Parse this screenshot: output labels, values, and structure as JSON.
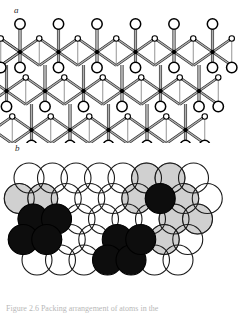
{
  "figure": {
    "panels": [
      {
        "id": "a",
        "label": "a",
        "type": "ball-and-stick-lattice",
        "description": "Ball-and-stick model of a layered hexagonal crystal lattice with large open circles, small open circles and filled black nodes joined by double-line bonds",
        "colors": {
          "node_fill": "#000000",
          "circle_fill": "#ffffff",
          "circle_stroke": "#000000",
          "bond_light": "#b0b0b0",
          "bond_dark": "#222222"
        },
        "geometry": {
          "cell_dx": 38.5,
          "row_dy": 39.0,
          "origin_x": 20.0,
          "origin_y": 44.0,
          "rows": 3,
          "cols": 6,
          "large_circle_r": 5.2,
          "small_circle_r": 2.7,
          "node_r": 2.2
        }
      },
      {
        "id": "b",
        "label": "b",
        "type": "close-packed-sphere-model",
        "description": "Close-packed sphere model; overlapping outlined circles in offset rows with one gray-shaded layer and black filled clusters marking interstitial sites",
        "colors": {
          "open_fill": "#ffffff",
          "open_stroke": "#1a1a1a",
          "gray_fill": "#d0d0d0",
          "gray_stroke": "#555555",
          "black_fill": "#0d0d0d",
          "black_stroke": "#000000"
        },
        "geometry": {
          "radius": 15.0,
          "dx": 23.5,
          "dy": 20.5,
          "origin_x": 29.0,
          "origin_y": 178.0,
          "rows": 5
        },
        "clusters": [
          {
            "name": "left-black-tetrad",
            "count": 4,
            "shape": "diamond"
          },
          {
            "name": "right-black-single",
            "count": 1,
            "shape": "single"
          },
          {
            "name": "bottom-black-triad",
            "count": 4,
            "shape": "triangle"
          }
        ]
      }
    ]
  },
  "caption": {
    "text": "Figure 2.6  Packing arrangement of atoms in the"
  }
}
